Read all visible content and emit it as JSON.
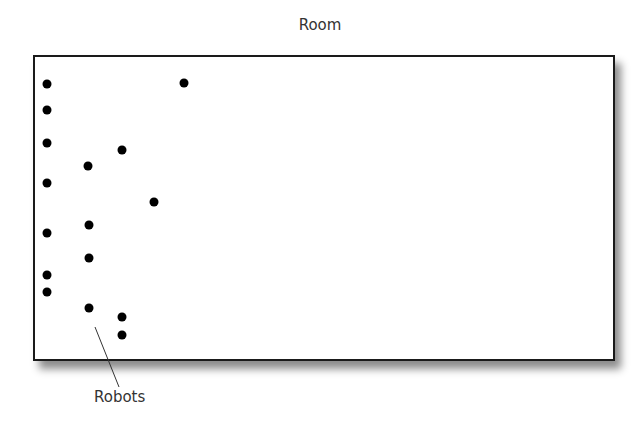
{
  "diagram": {
    "title": "Room",
    "robots_label": "Robots",
    "colors": {
      "border": "#1a1a1a",
      "robot": "#000000",
      "text": "#333333"
    },
    "robots": [
      {
        "x": 47,
        "y": 84
      },
      {
        "x": 47,
        "y": 110
      },
      {
        "x": 47,
        "y": 143
      },
      {
        "x": 47,
        "y": 183
      },
      {
        "x": 47,
        "y": 233
      },
      {
        "x": 47,
        "y": 275
      },
      {
        "x": 47,
        "y": 292
      },
      {
        "x": 88,
        "y": 166
      },
      {
        "x": 89,
        "y": 225
      },
      {
        "x": 89,
        "y": 258
      },
      {
        "x": 89,
        "y": 308
      },
      {
        "x": 122,
        "y": 150
      },
      {
        "x": 122,
        "y": 317
      },
      {
        "x": 122,
        "y": 335
      },
      {
        "x": 154,
        "y": 202
      },
      {
        "x": 184,
        "y": 83
      }
    ],
    "leader_line": {
      "x1": 95,
      "y1": 327,
      "x2": 119,
      "y2": 387
    }
  }
}
